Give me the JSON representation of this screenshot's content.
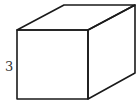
{
  "figure": {
    "type": "cube",
    "edge_label": "3",
    "colors": {
      "stroke": "#1a1a1a",
      "label": "#333333",
      "background": "#ffffff"
    },
    "vertices": {
      "front_top_left": [
        17,
        30
      ],
      "front_top_right": [
        88,
        30
      ],
      "front_bottom_left": [
        17,
        99
      ],
      "front_bottom_right": [
        88,
        99
      ],
      "back_top_left": [
        64,
        5
      ],
      "back_top_right": [
        135,
        5
      ],
      "back_bottom_right": [
        135,
        73
      ]
    }
  }
}
